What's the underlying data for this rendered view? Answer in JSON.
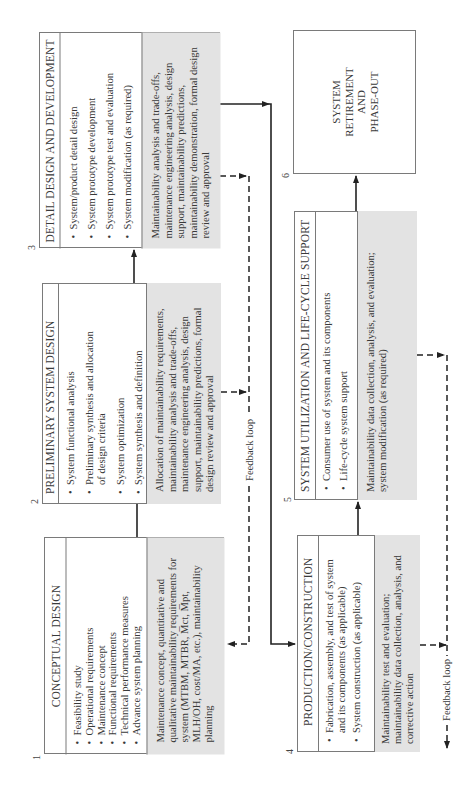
{
  "diagram": {
    "orientation": "rotated-90-ccw",
    "colors": {
      "box_border": "#7a7a7a",
      "gray_fill": "#e3e3e3",
      "line": "#222222"
    },
    "phases": [
      {
        "number": "1",
        "title": "CONCEPTUAL DESIGN",
        "items": [
          "Feasibility study",
          "Operational requirements",
          "Maintenance concept",
          "Functional requirements",
          "Technical performance measures",
          "Advance system planning"
        ],
        "maintainability_text_pre": "Maintenance concept, quantitative and qualitative maintainability requirements for system (MTBM, MTBR, ",
        "mct": "M̅ct",
        "maintainability_text_mid": ", ",
        "mpt": "M̅pt",
        "maintainability_text_post": ", MLH/OH, cost/MA, etc.), maintainability planning"
      },
      {
        "number": "2",
        "title": "PRELIMINARY SYSTEM DESIGN",
        "items": [
          "System functional analysis",
          "Preliminary synthesis and allocation of design criteria",
          "System optimization",
          "System synthesis and definition"
        ],
        "maintainability_text": "Allocation of maintainability requirements, maintainability analysis and trade-offs, maintenance engineering analysis, design support, maintainability predictions, formal design review and approval"
      },
      {
        "number": "3",
        "title": "DETAIL DESIGN AND DEVELOPMENT",
        "items": [
          "System/product detail design",
          "System prototype development",
          "System prototype test and evaluation",
          "System modification (as required)"
        ],
        "maintainability_text": "Maintainability analysis and trade-offs, maintenance engineering analysis, design support, maintainability predictions, maintainability demonstration, formal design review and approval"
      },
      {
        "number": "4",
        "title": "PRODUCTION/CONSTRUCTION",
        "items": [
          "Fabrication, assembly, and test of system and its components (as applicable)",
          "System construction (as applicable)"
        ],
        "maintainability_text": "Maintainability test and evaluation; maintainability data collection, analysis, and corrective action"
      },
      {
        "number": "5",
        "title": "SYSTEM UTILIZATION AND LIFE-CYCLE SUPPORT",
        "items": [
          "Consumer use of system and its components",
          "Life-cycle system support"
        ],
        "maintainability_text": "Maintainability data collection, analysis, and evaluation; system modification (as required)"
      },
      {
        "number": "6",
        "title_lines": [
          "SYSTEM",
          "RETIREMENT",
          "AND",
          "PHASE-OUT"
        ]
      }
    ],
    "feedback_labels": [
      "Feedback loop",
      "Feedback loop"
    ]
  }
}
